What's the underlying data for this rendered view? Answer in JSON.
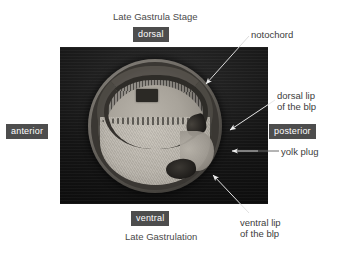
{
  "figure": {
    "title_top": "Late Gastrula Stage",
    "title_bottom": "Late Gastrulation"
  },
  "axis_tags": {
    "dorsal": "dorsal",
    "ventral": "ventral",
    "anterior": "anterior",
    "posterior": "posterior"
  },
  "annotations": [
    {
      "name": "notochord",
      "line1": "notochord",
      "line2": ""
    },
    {
      "name": "dorsal-lip",
      "line1": "dorsal lip",
      "line2": "of the blp"
    },
    {
      "name": "yolk-plug",
      "line1": "yolk plug",
      "line2": ""
    },
    {
      "name": "ventral-lip",
      "line1": "ventral lip",
      "line2": "of the blp"
    }
  ],
  "colors": {
    "tag_background": "#4d4d4d",
    "tag_text": "#ffffff",
    "caption_text": "#4a4a4a",
    "annotation_text": "#3c3c3c",
    "photo_background": "#0a0a0a",
    "page_background": "#ffffff",
    "leader_line_dark": "#555555",
    "leader_line_light": "#e8e8e8"
  }
}
